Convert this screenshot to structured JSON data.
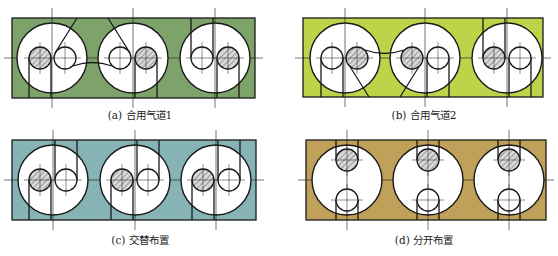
{
  "figure": {
    "panels": [
      {
        "id": "a",
        "caption": "(a) 合用气道1",
        "layout": "shared-passage-1",
        "bg_color": "#7ea36a",
        "rect": {
          "x": 12,
          "y": 18,
          "w": 243,
          "h": 80
        },
        "bores": [
          {
            "cx": 52,
            "cy": 58,
            "valves": [
              {
                "cx": 40,
                "cy": 58,
                "hatched": true
              },
              {
                "cx": 65,
                "cy": 58,
                "hatched": false
              }
            ]
          },
          {
            "cx": 133,
            "cy": 58,
            "valves": [
              {
                "cx": 120,
                "cy": 58,
                "hatched": false
              },
              {
                "cx": 146,
                "cy": 58,
                "hatched": true
              }
            ]
          },
          {
            "cx": 215,
            "cy": 58,
            "valves": [
              {
                "cx": 202,
                "cy": 58,
                "hatched": false
              },
              {
                "cx": 228,
                "cy": 58,
                "hatched": true
              }
            ]
          }
        ]
      },
      {
        "id": "b",
        "caption": "(b) 合用气道2",
        "layout": "shared-passage-2",
        "bg_color": "#bcd34a",
        "rect": {
          "x": 303,
          "y": 18,
          "w": 240,
          "h": 79
        },
        "bores": [
          {
            "cx": 345,
            "cy": 58,
            "valves": [
              {
                "cx": 332,
                "cy": 58,
                "hatched": false
              },
              {
                "cx": 357,
                "cy": 58,
                "hatched": true
              }
            ]
          },
          {
            "cx": 425,
            "cy": 58,
            "valves": [
              {
                "cx": 412,
                "cy": 58,
                "hatched": true
              },
              {
                "cx": 438,
                "cy": 58,
                "hatched": false
              }
            ]
          },
          {
            "cx": 507,
            "cy": 58,
            "valves": [
              {
                "cx": 494,
                "cy": 58,
                "hatched": true
              },
              {
                "cx": 520,
                "cy": 58,
                "hatched": false
              }
            ]
          }
        ]
      },
      {
        "id": "c",
        "caption": "(c) 交替布置",
        "layout": "alternating",
        "bg_color": "#86b3b6",
        "rect": {
          "x": 12,
          "y": 140,
          "w": 244,
          "h": 80
        },
        "bores": [
          {
            "cx": 53,
            "cy": 180,
            "valves": [
              {
                "cx": 40,
                "cy": 180,
                "hatched": true
              },
              {
                "cx": 66,
                "cy": 180,
                "hatched": false
              }
            ]
          },
          {
            "cx": 135,
            "cy": 180,
            "valves": [
              {
                "cx": 122,
                "cy": 180,
                "hatched": true
              },
              {
                "cx": 148,
                "cy": 180,
                "hatched": false
              }
            ]
          },
          {
            "cx": 216,
            "cy": 180,
            "valves": [
              {
                "cx": 203,
                "cy": 180,
                "hatched": true
              },
              {
                "cx": 229,
                "cy": 180,
                "hatched": false
              }
            ]
          }
        ]
      },
      {
        "id": "d",
        "caption": "(d) 分开布置",
        "layout": "separated",
        "bg_color": "#c0a15a",
        "rect": {
          "x": 306,
          "y": 140,
          "w": 240,
          "h": 80
        },
        "bores": [
          {
            "cx": 347,
            "cy": 180,
            "valves": [
              {
                "cx": 347,
                "cy": 160,
                "hatched": true
              },
              {
                "cx": 347,
                "cy": 200,
                "hatched": false
              }
            ]
          },
          {
            "cx": 428,
            "cy": 180,
            "valves": [
              {
                "cx": 428,
                "cy": 160,
                "hatched": true
              },
              {
                "cx": 428,
                "cy": 200,
                "hatched": false
              }
            ]
          },
          {
            "cx": 509,
            "cy": 180,
            "valves": [
              {
                "cx": 509,
                "cy": 160,
                "hatched": true
              },
              {
                "cx": 509,
                "cy": 200,
                "hatched": false
              }
            ]
          }
        ]
      }
    ],
    "style": {
      "stroke": "#1a1a1a",
      "bore_fill": "#ffffff",
      "hatch_color": "#777777",
      "hatch_bg": "#d9d9d9",
      "bore_radius": 35,
      "valve_radius": 11
    }
  }
}
